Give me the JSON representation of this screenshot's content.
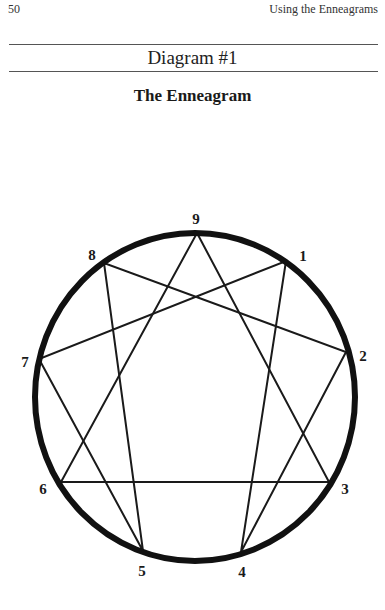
{
  "header": {
    "page_number": "50",
    "running_head": "Using the Enneagrams"
  },
  "diagram": {
    "label": "Diagram #1",
    "title": "The Enneagram",
    "circle": {
      "cx": 195,
      "cy": 397,
      "rx": 160,
      "ry": 164,
      "stroke": "#111111",
      "stroke_width": 6
    },
    "points": [
      {
        "id": "9",
        "x": 197,
        "y": 233,
        "label_x": 196,
        "label_y": 221
      },
      {
        "id": "1",
        "x": 286,
        "y": 261,
        "label_x": 303,
        "label_y": 258
      },
      {
        "id": "2",
        "x": 346,
        "y": 352,
        "label_x": 363,
        "label_y": 358
      },
      {
        "id": "3",
        "x": 329,
        "y": 482,
        "label_x": 345,
        "label_y": 491
      },
      {
        "id": "4",
        "x": 241,
        "y": 552,
        "label_x": 242,
        "label_y": 574
      },
      {
        "id": "5",
        "x": 143,
        "y": 551,
        "label_x": 142,
        "label_y": 573
      },
      {
        "id": "6",
        "x": 61,
        "y": 482,
        "label_x": 43,
        "label_y": 491
      },
      {
        "id": "7",
        "x": 39,
        "y": 359,
        "label_x": 25,
        "label_y": 364
      },
      {
        "id": "8",
        "x": 104,
        "y": 263,
        "label_x": 92,
        "label_y": 257
      }
    ],
    "triangle": [
      "9",
      "3",
      "6"
    ],
    "hexad": [
      "1",
      "4",
      "2",
      "8",
      "5",
      "7"
    ],
    "line_color": "#1a1a1a",
    "line_width": 2
  }
}
